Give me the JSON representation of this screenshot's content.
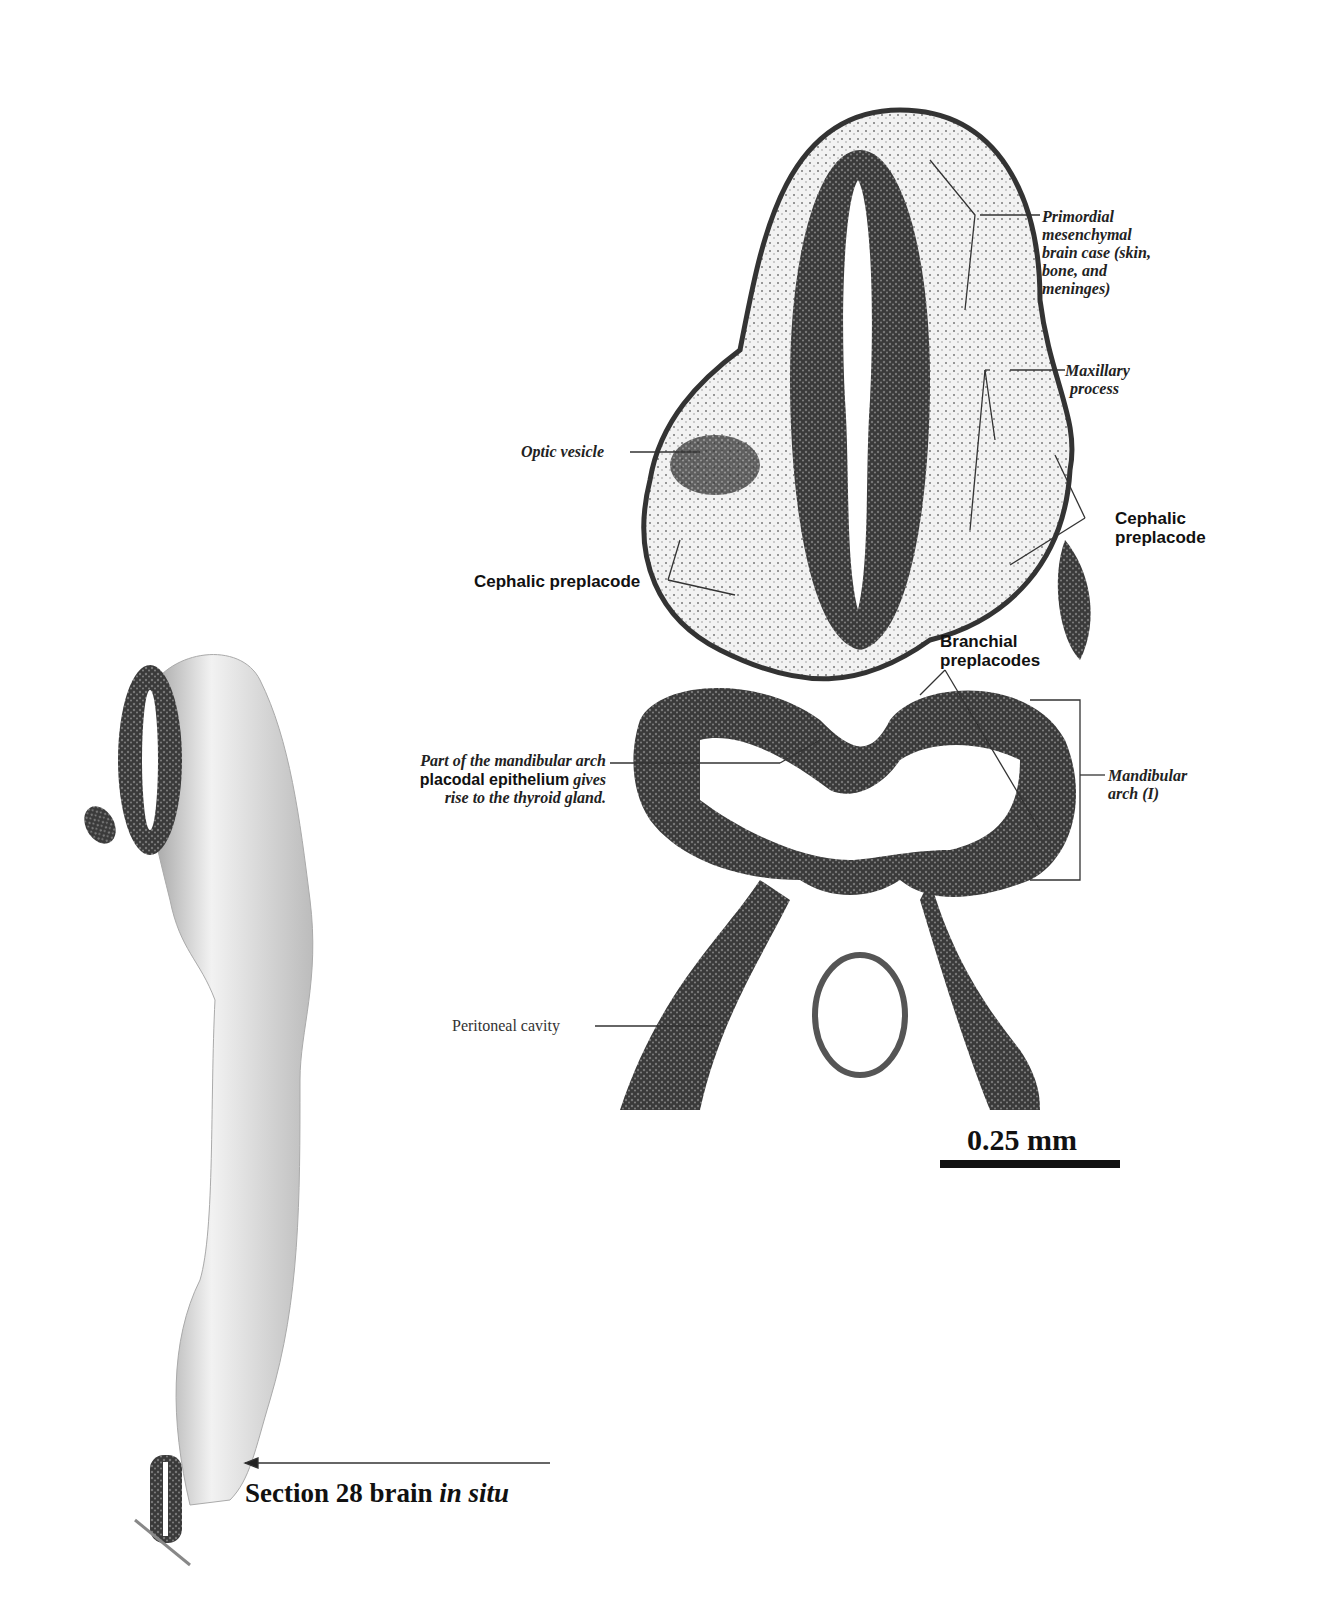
{
  "figure": {
    "section_caption": {
      "prefix": "Section 28 brain ",
      "italic": "in situ"
    },
    "scale_bar": {
      "label": "0.25 mm"
    },
    "labels": {
      "primordial": [
        "Primordial",
        "mesenchymal",
        "brain case (skin,",
        "bone, and",
        "meninges)"
      ],
      "maxillary": [
        "Maxillary",
        "process"
      ],
      "optic_vesicle": "Optic vesicle",
      "cephalic_left": "Cephalic preplacode",
      "cephalic_right": [
        "Cephalic",
        "preplacode"
      ],
      "branchial": [
        "Branchial",
        "preplacodes"
      ],
      "mandibular_note": {
        "line1": "Part of the mandibular arch",
        "line2_bold": "placodal epithelium",
        "line2_italic": " gives",
        "line3": "rise to the thyroid gland."
      },
      "mandibular_arch": [
        "Mandibular",
        "arch (I)"
      ],
      "peritoneal": "Peritoneal cavity"
    }
  }
}
